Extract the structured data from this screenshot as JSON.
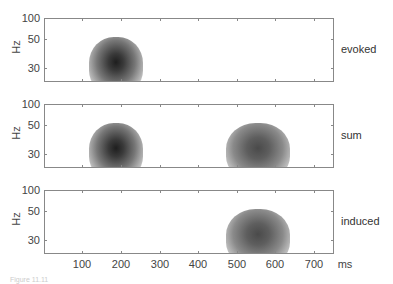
{
  "chart_data": {
    "type": "heatmap",
    "title": "",
    "xlabel": "ms",
    "ylabel": "Hz",
    "xlim": [
      0,
      750
    ],
    "x_ticks": [
      100,
      200,
      300,
      400,
      500,
      600,
      700
    ],
    "y_ticks": [
      30,
      50,
      100
    ],
    "y_scale": "log",
    "panels": [
      {
        "label": "evoked",
        "blobs": [
          {
            "center_ms": 190,
            "center_hz": 35,
            "intensity": 0.95
          }
        ]
      },
      {
        "label": "sum",
        "blobs": [
          {
            "center_ms": 190,
            "center_hz": 35,
            "intensity": 0.95
          },
          {
            "center_ms": 550,
            "center_hz": 35,
            "intensity": 0.75
          }
        ]
      },
      {
        "label": "induced",
        "blobs": [
          {
            "center_ms": 550,
            "center_hz": 35,
            "intensity": 0.75
          }
        ]
      }
    ]
  },
  "axes": {
    "ylabel": "Hz",
    "yticks": [
      "100",
      "50",
      "30"
    ],
    "xticks": [
      "100",
      "200",
      "300",
      "400",
      "500",
      "600",
      "700"
    ],
    "xunit": "ms"
  },
  "panels": [
    {
      "label": "evoked"
    },
    {
      "label": "sum"
    },
    {
      "label": "induced"
    }
  ],
  "caption": "Figure 11.11"
}
